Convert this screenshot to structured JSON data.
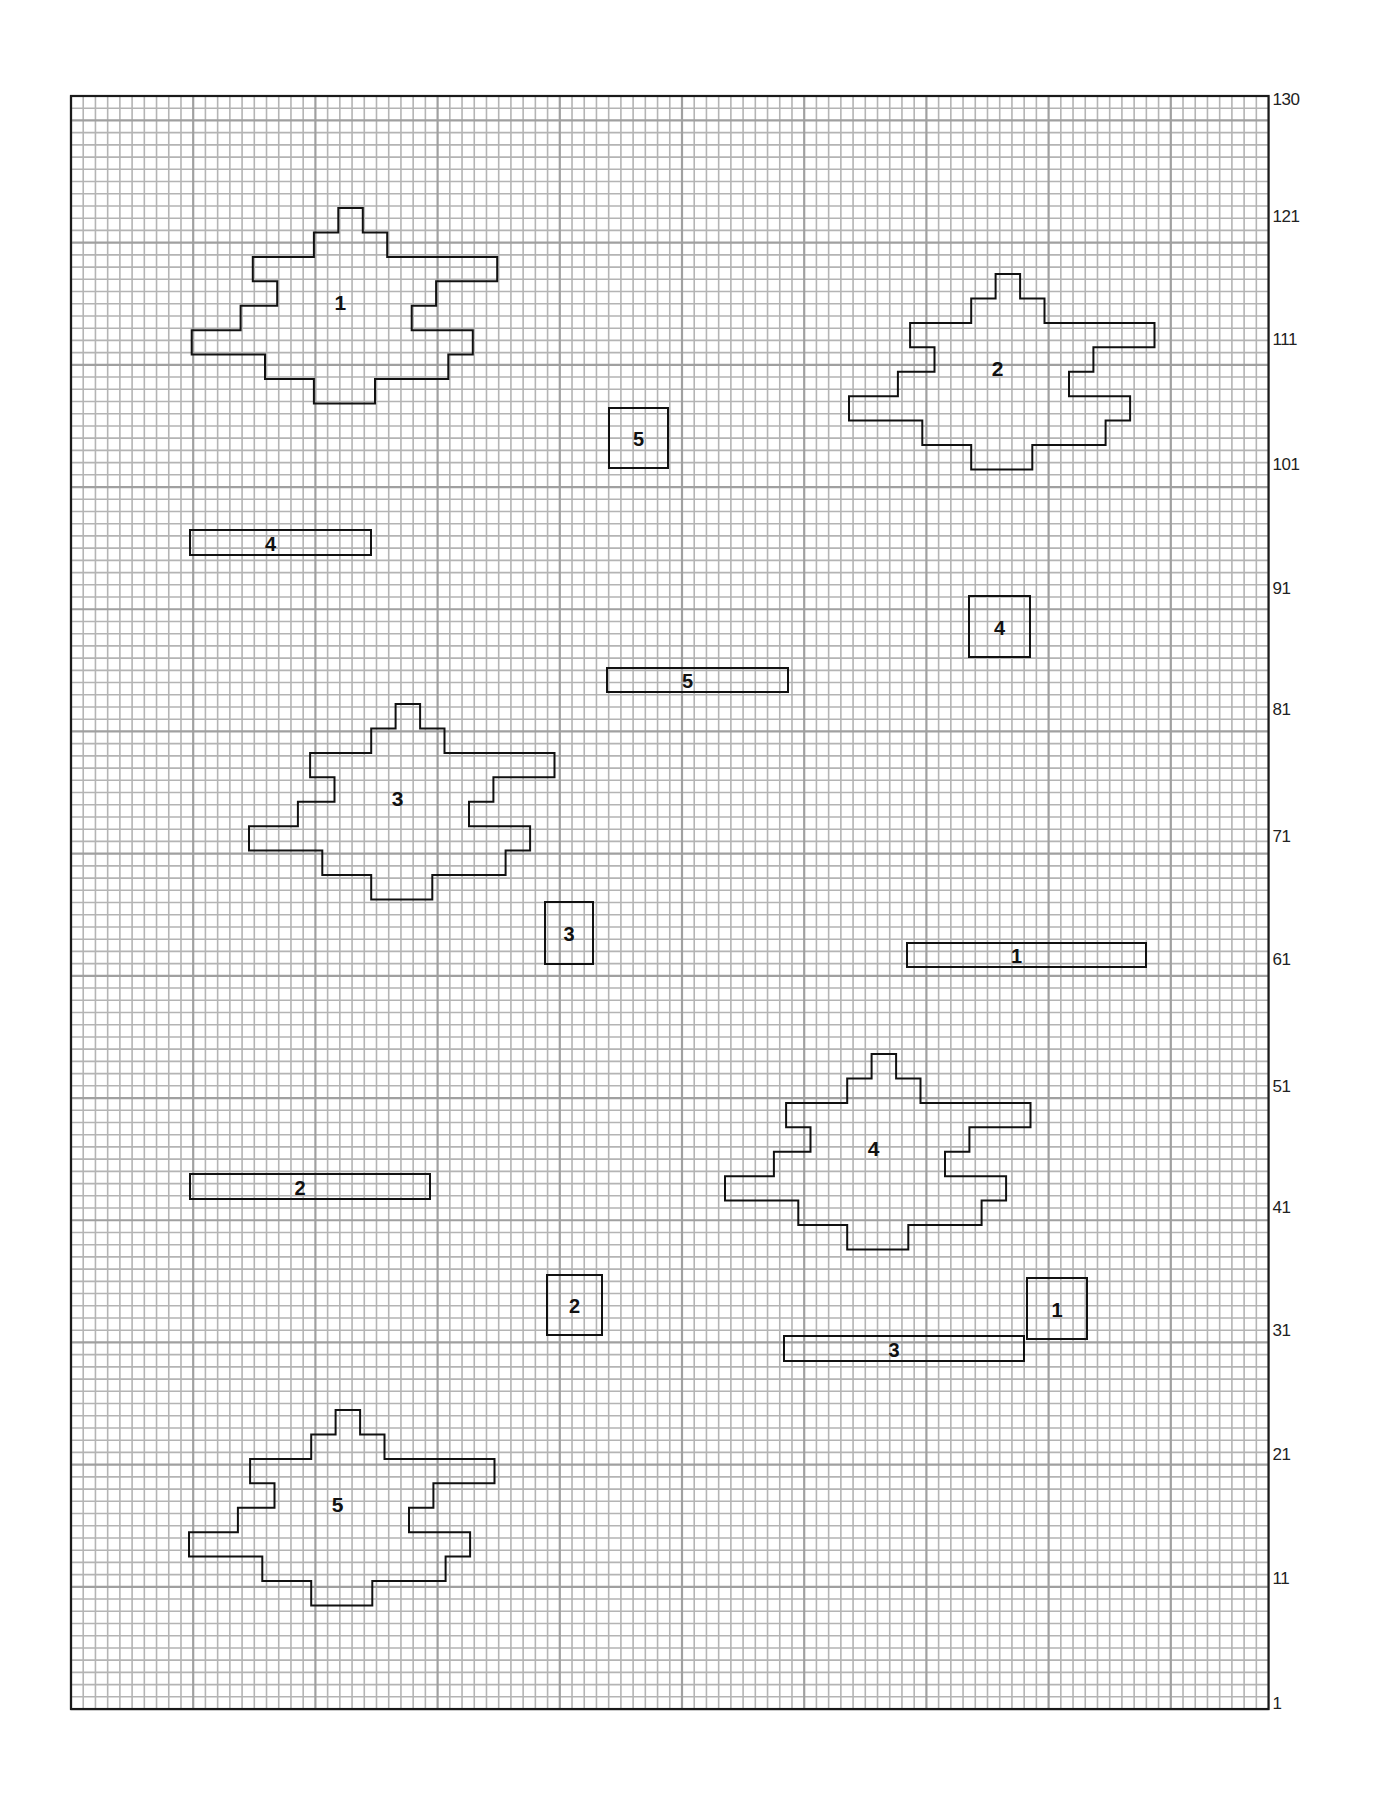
{
  "canvas": {
    "left": 71,
    "top": 96,
    "cols": 98,
    "rows": 132,
    "cell": 12.22,
    "grid_color": "#b4b4b4",
    "major_grid_color": "#a0a0a0",
    "border_color": "#1a1a1a",
    "outline_color": "#111111"
  },
  "row_labels": [
    {
      "text": "130",
      "y": 101
    },
    {
      "text": "121",
      "y": 218
    },
    {
      "text": "111",
      "y": 341
    },
    {
      "text": "101",
      "y": 466
    },
    {
      "text": "91",
      "y": 590
    },
    {
      "text": "81",
      "y": 711
    },
    {
      "text": "71",
      "y": 838
    },
    {
      "text": "61",
      "y": 961
    },
    {
      "text": "51",
      "y": 1088
    },
    {
      "text": "41",
      "y": 1209
    },
    {
      "text": "31",
      "y": 1332
    },
    {
      "text": "21",
      "y": 1456
    },
    {
      "text": "11",
      "y": 1580
    },
    {
      "text": "1",
      "y": 1705
    }
  ],
  "star_template": [
    [
      12,
      0
    ],
    [
      14,
      0
    ],
    [
      14,
      2
    ],
    [
      16,
      2
    ],
    [
      16,
      4
    ],
    [
      25,
      4
    ],
    [
      25,
      6
    ],
    [
      20,
      6
    ],
    [
      20,
      8
    ],
    [
      18,
      8
    ],
    [
      18,
      10
    ],
    [
      23,
      10
    ],
    [
      23,
      12
    ],
    [
      21,
      12
    ],
    [
      21,
      14
    ],
    [
      15,
      14
    ],
    [
      15,
      16
    ],
    [
      10,
      16
    ],
    [
      10,
      14
    ],
    [
      6,
      14
    ],
    [
      6,
      12
    ],
    [
      0,
      12
    ],
    [
      0,
      10
    ],
    [
      4,
      10
    ],
    [
      4,
      8
    ],
    [
      7,
      8
    ],
    [
      7,
      6
    ],
    [
      5,
      6
    ],
    [
      5,
      4
    ],
    [
      10,
      4
    ],
    [
      10,
      2
    ],
    [
      12,
      2
    ]
  ],
  "pieces": {
    "stars": [
      {
        "label": "1",
        "x": 191.7,
        "y": 208,
        "label_x": 12,
        "label_y": 8
      },
      {
        "label": "2",
        "x": 849,
        "y": 274,
        "label_x": 12,
        "label_y": 8
      },
      {
        "label": "3",
        "x": 249,
        "y": 704,
        "label_x": 12,
        "label_y": 8
      },
      {
        "label": "4",
        "x": 725,
        "y": 1054,
        "label_x": 12,
        "label_y": 8
      },
      {
        "label": "5",
        "x": 189,
        "y": 1410,
        "label_x": 12,
        "label_y": 8
      }
    ],
    "squares": [
      {
        "label": "5",
        "x": 609,
        "y": 408,
        "w": 59,
        "h": 60
      },
      {
        "label": "4",
        "x": 969,
        "y": 596,
        "w": 61,
        "h": 61
      },
      {
        "label": "3",
        "x": 545,
        "y": 902,
        "w": 48,
        "h": 62
      },
      {
        "label": "2",
        "x": 547,
        "y": 1275,
        "w": 55,
        "h": 60
      },
      {
        "label": "1",
        "x": 1027,
        "y": 1278,
        "w": 60,
        "h": 61
      }
    ],
    "strips": [
      {
        "label": "4",
        "x": 190,
        "y": 530,
        "w": 181,
        "h": 25
      },
      {
        "label": "5",
        "x": 607,
        "y": 668,
        "w": 181,
        "h": 24
      },
      {
        "label": "1",
        "x": 907,
        "y": 943,
        "w": 239,
        "h": 24
      },
      {
        "label": "2",
        "x": 190,
        "y": 1174,
        "w": 240,
        "h": 25
      },
      {
        "label": "3",
        "x": 784,
        "y": 1336,
        "w": 240,
        "h": 25
      }
    ]
  }
}
